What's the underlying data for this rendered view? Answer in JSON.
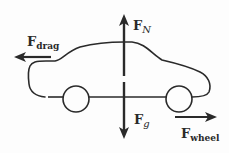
{
  "diagram": {
    "colors": {
      "ink": "#2a2a2a",
      "background": "#fdfdfd"
    },
    "forces": [
      {
        "id": "normal",
        "label_main": "F",
        "label_sub": "N",
        "direction": "up"
      },
      {
        "id": "drag",
        "label_main": "F",
        "label_sub": "drag",
        "direction": "left"
      },
      {
        "id": "gravity",
        "label_main": "F",
        "label_sub": "g",
        "direction": "down"
      },
      {
        "id": "wheel",
        "label_main": "F",
        "label_sub": "wheel",
        "direction": "right"
      }
    ],
    "objects": [
      {
        "id": "car-body",
        "type": "outline"
      },
      {
        "id": "front-wheel",
        "type": "circle"
      },
      {
        "id": "rear-wheel",
        "type": "circle"
      }
    ]
  }
}
